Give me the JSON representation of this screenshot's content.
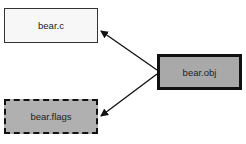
{
  "diagram": {
    "nodes": [
      {
        "id": "bear_c",
        "label": "bear.c",
        "style": "solid-thin",
        "fill": "#f7f7f7"
      },
      {
        "id": "bear_obj",
        "label": "bear.obj",
        "style": "solid-thick",
        "fill": "#a9a9a9"
      },
      {
        "id": "bear_flags",
        "label": "bear.flags",
        "style": "dashed",
        "fill": "#b0b0b0"
      }
    ],
    "edges": [
      {
        "from": "bear_obj",
        "to": "bear_c"
      },
      {
        "from": "bear_obj",
        "to": "bear_flags"
      }
    ]
  }
}
